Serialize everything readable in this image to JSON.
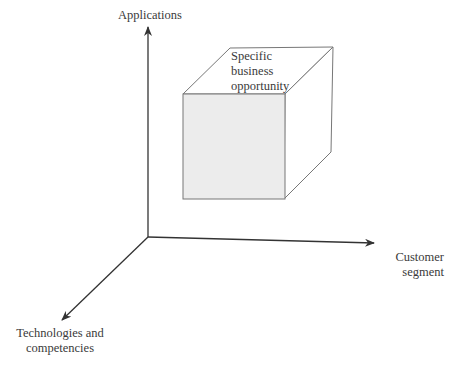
{
  "diagram": {
    "axes": {
      "vertical": {
        "label": "Applications"
      },
      "horizontal": {
        "label_line1": "Customer",
        "label_line2": "segment"
      },
      "diagonal": {
        "label_line1": "Technologies and",
        "label_line2": "competencies"
      }
    },
    "cube": {
      "label_line1": "Specific",
      "label_line2": "business",
      "label_line3": "opportunity",
      "front_fill": "#ececec",
      "edge_color": "#777777"
    },
    "axis_color": "#333333"
  }
}
